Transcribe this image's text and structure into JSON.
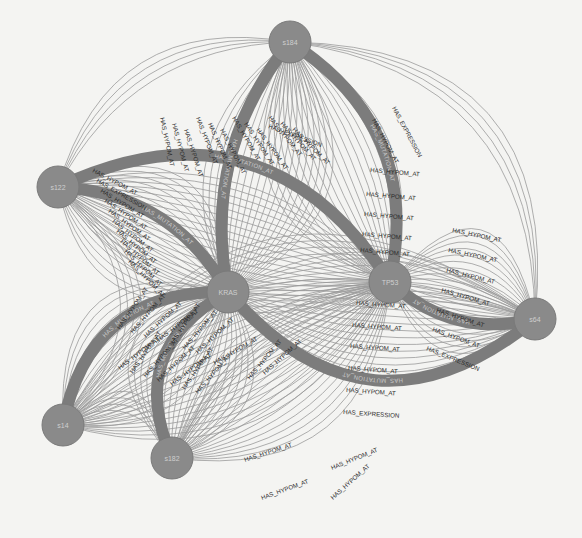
{
  "graph": {
    "nodes": [
      {
        "id": "s184",
        "label": "s184",
        "x": 290,
        "y": 42,
        "r": 21
      },
      {
        "id": "s122",
        "label": "s122",
        "x": 58,
        "y": 187,
        "r": 21
      },
      {
        "id": "KRAS",
        "label": "KRAS",
        "x": 228,
        "y": 292,
        "r": 21
      },
      {
        "id": "TP53",
        "label": "TP53",
        "x": 390,
        "y": 282,
        "r": 21
      },
      {
        "id": "s64",
        "label": "s64",
        "x": 535,
        "y": 319,
        "r": 21
      },
      {
        "id": "s14",
        "label": "s14",
        "x": 63,
        "y": 425,
        "r": 21
      },
      {
        "id": "s182",
        "label": "s182",
        "x": 172,
        "y": 458,
        "r": 21
      }
    ],
    "thick_edges": [
      {
        "from": "s122",
        "to": "TP53",
        "label": "HAS_MUTATION_AT"
      },
      {
        "from": "s184",
        "to": "TP53",
        "label": "HAS_MUTATION_AT"
      },
      {
        "from": "s184",
        "to": "KRAS",
        "label": "HAS_MUTATION_AT"
      },
      {
        "from": "s122",
        "to": "KRAS",
        "label": "HAS_MUTATION_AT"
      },
      {
        "from": "s64",
        "to": "TP53",
        "label": "HAS_MUTATION_AT"
      },
      {
        "from": "s64",
        "to": "KRAS",
        "label": "HAS_MUTATION_AT"
      },
      {
        "from": "s14",
        "to": "KRAS",
        "label": "HAS_MUTATION_AT"
      },
      {
        "from": "s182",
        "to": "KRAS",
        "label": "HAS_MUTATION_AT"
      }
    ],
    "edge_label_types": [
      "HAS_HYPOM_AT",
      "HAS_EXPRESSION",
      "HAS_MUTATION_AT"
    ],
    "visible_edge_labels": [
      {
        "text": "HAS_EXPRESSION",
        "x": 268,
        "y": 128,
        "rot": 20
      },
      {
        "text": "HAS_EXPRESSION",
        "x": 392,
        "y": 108,
        "rot": 62
      },
      {
        "text": "HAS_HYPOM_AT",
        "x": 372,
        "y": 120,
        "rot": 62
      },
      {
        "text": "HAS_HYPOM_AT",
        "x": 370,
        "y": 172,
        "rot": 5
      },
      {
        "text": "HAS_HYPOM_AT",
        "x": 366,
        "y": 196,
        "rot": 5
      },
      {
        "text": "HAS_HYPOM_AT",
        "x": 364,
        "y": 216,
        "rot": 5
      },
      {
        "text": "HAS_HYPOM_AT",
        "x": 362,
        "y": 236,
        "rot": 5
      },
      {
        "text": "HAS_HYPOM_AT",
        "x": 360,
        "y": 252,
        "rot": 5
      },
      {
        "text": "HAS_HYPOM_AT",
        "x": 452,
        "y": 232,
        "rot": 12
      },
      {
        "text": "HAS_HYPOM_AT",
        "x": 448,
        "y": 252,
        "rot": 12
      },
      {
        "text": "HAS_HYPOM_AT",
        "x": 446,
        "y": 272,
        "rot": 14
      },
      {
        "text": "HAS_HYPOM_AT",
        "x": 441,
        "y": 292,
        "rot": 16
      },
      {
        "text": "HAS_HYPOM_AT",
        "x": 436,
        "y": 312,
        "rot": 18
      },
      {
        "text": "HAS_HYPOM_AT",
        "x": 432,
        "y": 331,
        "rot": 20
      },
      {
        "text": "HAS_EXPRESSION",
        "x": 426,
        "y": 350,
        "rot": 22
      },
      {
        "text": "HAS_HYPOM_AT",
        "x": 356,
        "y": 305,
        "rot": 4
      },
      {
        "text": "HAS_HYPOM_AT",
        "x": 352,
        "y": 327,
        "rot": 4
      },
      {
        "text": "HAS_HYPOM_AT",
        "x": 350,
        "y": 348,
        "rot": 4
      },
      {
        "text": "HAS_HYPOM_AT",
        "x": 348,
        "y": 370,
        "rot": 4
      },
      {
        "text": "HAS_HYPOM_AT",
        "x": 346,
        "y": 392,
        "rot": 4
      },
      {
        "text": "HAS_EXPRESSION",
        "x": 343,
        "y": 414,
        "rot": 4
      },
      {
        "text": "HAS_HYPOM_AT",
        "x": 332,
        "y": 470,
        "rot": -22
      },
      {
        "text": "HAS_HYPOM_AT",
        "x": 333,
        "y": 500,
        "rot": -42
      },
      {
        "text": "HAS_HYPOM_AT",
        "x": 245,
        "y": 462,
        "rot": -18
      },
      {
        "text": "HAS_HYPOM_AT",
        "x": 262,
        "y": 500,
        "rot": -20
      },
      {
        "text": "HAS_HYPOM_AT",
        "x": 215,
        "y": 365,
        "rot": -30
      },
      {
        "text": "HAS_HYPOM_AT",
        "x": 265,
        "y": 375,
        "rot": -42
      },
      {
        "text": "HAS_HYPOM_AT",
        "x": 250,
        "y": 380,
        "rot": -50
      }
    ]
  }
}
